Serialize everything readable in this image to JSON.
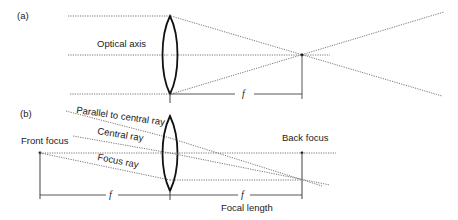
{
  "panel_a": {
    "label": "(a)",
    "optical_axis_label": "Optical axis",
    "focal_symbol": "f"
  },
  "panel_b": {
    "label": "(b)",
    "ray_labels": {
      "parallel": "Parallel to central ray",
      "central": "Central ray",
      "focus": "Focus ray"
    },
    "front_focus_label": "Front focus",
    "back_focus_label": "Back focus",
    "focal_symbol_front": "f",
    "focal_symbol_back": "f",
    "focal_length_label": "Focal length"
  }
}
